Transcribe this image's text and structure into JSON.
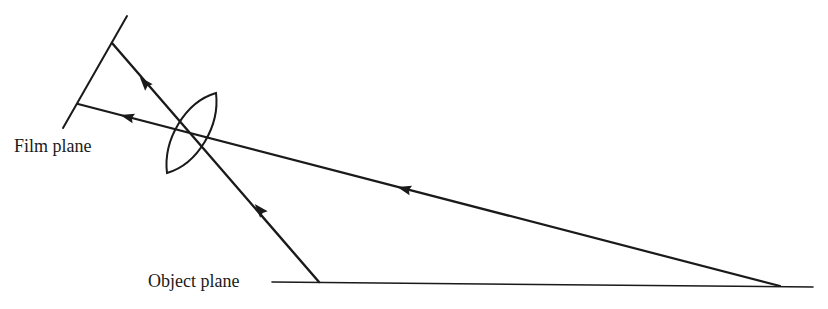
{
  "diagram": {
    "type": "optics-ray-diagram",
    "labels": {
      "film_plane": "Film plane",
      "object_plane": "Object plane"
    },
    "colors": {
      "line": "#1a1a1a",
      "background": "#ffffff"
    },
    "elements": {
      "film_plane": {
        "x1": 127,
        "y1": 16,
        "x2": 63,
        "y2": 128
      },
      "object_plane": {
        "x1": 272,
        "y1": 282,
        "x2": 813,
        "y2": 287
      },
      "lens": {
        "top": [
          216,
          93
        ],
        "bottom": [
          167,
          173
        ]
      },
      "rays": [
        {
          "name": "ray-from-near-object",
          "from": [
            319,
            282
          ],
          "to": [
            112,
            43
          ],
          "arrows": [
            [
              260,
              210
            ],
            [
              145,
              83
            ]
          ]
        },
        {
          "name": "ray-from-far-object",
          "from": [
            780,
            286
          ],
          "to": [
            78,
            104
          ],
          "arrows": [
            [
              405,
              189
            ],
            [
              128,
              118
            ]
          ]
        }
      ]
    }
  }
}
